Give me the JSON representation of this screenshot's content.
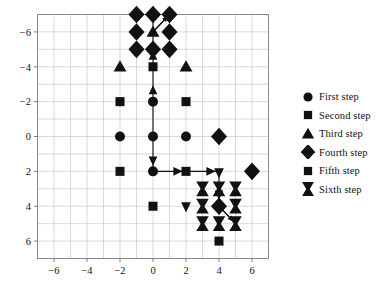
{
  "chart_data": {
    "type": "scatter",
    "title": "",
    "xlabel": "",
    "ylabel": "",
    "xlim": [
      -7,
      7
    ],
    "ylim": [
      7,
      -7
    ],
    "y_axis_inverted": true,
    "grid": true,
    "xticks": [
      -6,
      -4,
      -2,
      0,
      2,
      4,
      6
    ],
    "yticks": [
      -6,
      -4,
      -2,
      0,
      2,
      4,
      6
    ],
    "xtick_labels": [
      "-6",
      "-4",
      "-2",
      "0",
      "2",
      "4",
      "6"
    ],
    "ytick_labels": [
      "-6",
      "-4",
      "-2",
      "0",
      "2",
      "4",
      "6"
    ],
    "minor_grid_step": 1,
    "legend_position": "right",
    "marker_color": "#111111",
    "grid_color": "#c9c9c9",
    "axis_color": "#808080",
    "series": [
      {
        "name": "First step",
        "marker": "circle",
        "points": [
          [
            -2,
            0
          ],
          [
            0,
            0
          ],
          [
            2,
            0
          ],
          [
            0,
            -2
          ],
          [
            0,
            2
          ]
        ]
      },
      {
        "name": "Second step",
        "marker": "square",
        "points": [
          [
            -2,
            -2
          ],
          [
            2,
            -2
          ],
          [
            -2,
            2
          ],
          [
            2,
            2
          ]
        ]
      },
      {
        "name": "Third step",
        "marker": "triangle",
        "points": [
          [
            -2,
            -4
          ],
          [
            2,
            -4
          ],
          [
            0,
            -6
          ]
        ]
      },
      {
        "name": "Fourth step",
        "marker": "diamond",
        "points": [
          [
            -1,
            -7
          ],
          [
            0,
            -7
          ],
          [
            1,
            -7
          ],
          [
            -1,
            -6
          ],
          [
            1,
            -6
          ],
          [
            -1,
            -5
          ],
          [
            0,
            -5
          ],
          [
            1,
            -5
          ],
          [
            4,
            0
          ],
          [
            6,
            2
          ],
          [
            4,
            4
          ]
        ]
      },
      {
        "name": "Fifth step",
        "marker": "square",
        "points": [
          [
            0,
            -4
          ],
          [
            0,
            4
          ],
          [
            4,
            6
          ]
        ]
      },
      {
        "name": "Sixth step",
        "marker": "bowtie",
        "points": [
          [
            3,
            3
          ],
          [
            4,
            3
          ],
          [
            5,
            3
          ],
          [
            3,
            4
          ],
          [
            5,
            4
          ],
          [
            3,
            5
          ],
          [
            4,
            5
          ],
          [
            5,
            5
          ]
        ]
      }
    ],
    "paths": [
      {
        "from": [
          0,
          2
        ],
        "to": [
          0,
          -7
        ],
        "arrowheads": [
          [
            0,
            1.3
          ],
          [
            0,
            -2.6
          ],
          [
            0,
            -4.6
          ]
        ]
      },
      {
        "from": [
          0,
          2
        ],
        "to": [
          4,
          2
        ],
        "arrowheads": [
          [
            1.5,
            2
          ],
          [
            3.4,
            2
          ]
        ]
      },
      {
        "from": [
          4,
          2
        ],
        "to": [
          4,
          4
        ],
        "arrowheads": [
          [
            4,
            3.2
          ]
        ]
      },
      {
        "from": [
          0,
          -6
        ],
        "to": [
          1,
          -7
        ],
        "arrowheads": [
          [
            1,
            -7
          ]
        ]
      },
      {
        "from": [
          4,
          4
        ],
        "to": [
          5,
          5
        ],
        "arrowheads": [
          [
            5,
            5
          ]
        ]
      },
      {
        "from": [
          2,
          4
        ],
        "to": [
          2,
          4
        ],
        "arrowheads": [
          [
            2,
            4
          ]
        ]
      }
    ]
  },
  "legend": {
    "items": [
      {
        "label": "First step",
        "marker": "circle"
      },
      {
        "label": "Second step",
        "marker": "square"
      },
      {
        "label": "Third step",
        "marker": "triangle"
      },
      {
        "label": "Fourth step",
        "marker": "diamond"
      },
      {
        "label": "Fifth step",
        "marker": "square"
      },
      {
        "label": "Sixth step",
        "marker": "bowtie"
      }
    ]
  }
}
